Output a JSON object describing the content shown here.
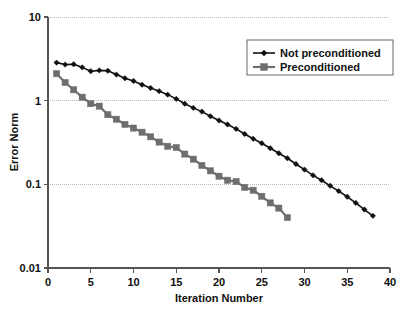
{
  "chart_data": {
    "type": "line",
    "title": "",
    "xlabel": "Iteration Number",
    "ylabel": "Error Norm",
    "xlim": [
      0,
      40
    ],
    "ylim": [
      0.01,
      10
    ],
    "yscale": "log",
    "xscale": "linear",
    "xticks": [
      0,
      5,
      10,
      15,
      20,
      25,
      30,
      35,
      40
    ],
    "xtick_labels": [
      "0",
      "5",
      "10",
      "15",
      "20",
      "25",
      "30",
      "35",
      "40"
    ],
    "yticks": [
      0.01,
      0.1,
      1,
      10
    ],
    "ytick_labels": [
      "0.01",
      "0.1",
      "1",
      "10"
    ],
    "grid": "horizontal-dotted",
    "legend_position": "top-right",
    "series": [
      {
        "name": "Not preconditioned",
        "color": "#101010",
        "marker": "diamond",
        "x": [
          1,
          2,
          3,
          4,
          5,
          6,
          7,
          8,
          9,
          10,
          11,
          12,
          13,
          14,
          15,
          16,
          17,
          18,
          19,
          20,
          21,
          22,
          23,
          24,
          25,
          26,
          27,
          28,
          29,
          30,
          31,
          32,
          33,
          34,
          35,
          36,
          37,
          38
        ],
        "values": [
          2.85,
          2.7,
          2.72,
          2.5,
          2.25,
          2.3,
          2.28,
          2.05,
          1.85,
          1.72,
          1.55,
          1.42,
          1.3,
          1.18,
          1.05,
          0.92,
          0.82,
          0.74,
          0.65,
          0.58,
          0.52,
          0.46,
          0.4,
          0.35,
          0.31,
          0.27,
          0.235,
          0.205,
          0.175,
          0.15,
          0.128,
          0.112,
          0.096,
          0.083,
          0.071,
          0.06,
          0.05,
          0.042
        ]
      },
      {
        "name": "Preconditioned",
        "color": "#6e6e6e",
        "marker": "square",
        "x": [
          1,
          2,
          3,
          4,
          5,
          6,
          7,
          8,
          9,
          10,
          11,
          12,
          13,
          14,
          15,
          16,
          17,
          18,
          19,
          20,
          21,
          22,
          23,
          24,
          25,
          26,
          27,
          28
        ],
        "values": [
          2.1,
          1.65,
          1.35,
          1.1,
          0.92,
          0.86,
          0.68,
          0.6,
          0.52,
          0.47,
          0.42,
          0.37,
          0.32,
          0.285,
          0.275,
          0.23,
          0.2,
          0.168,
          0.145,
          0.125,
          0.112,
          0.108,
          0.092,
          0.085,
          0.072,
          0.06,
          0.052,
          0.04
        ]
      }
    ]
  },
  "legend": {
    "entries": [
      {
        "label": "Not preconditioned"
      },
      {
        "label": "Preconditioned"
      }
    ]
  }
}
